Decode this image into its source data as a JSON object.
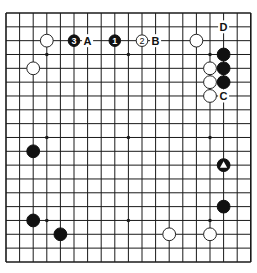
{
  "board": {
    "size": 19,
    "origin_x": 6,
    "origin_y": 13,
    "spacing_x": 13.6,
    "spacing_y": 13.83,
    "stone_radius": 6.4,
    "colors": {
      "black": "#111111",
      "white": "#ffffff",
      "line": "#1a1a1a"
    },
    "star_points": [
      [
        3,
        3
      ],
      [
        9,
        3
      ],
      [
        15,
        3
      ],
      [
        3,
        9
      ],
      [
        9,
        9
      ],
      [
        15,
        9
      ],
      [
        3,
        15
      ],
      [
        9,
        15
      ],
      [
        15,
        15
      ]
    ]
  },
  "stones": [
    {
      "color": "white",
      "col": 3,
      "row": 2
    },
    {
      "color": "white",
      "col": 2,
      "row": 4
    },
    {
      "color": "black",
      "col": 5,
      "row": 2,
      "number": "3"
    },
    {
      "color": "black",
      "col": 8,
      "row": 2,
      "number": "1"
    },
    {
      "color": "white",
      "col": 10,
      "row": 2,
      "number": "2"
    },
    {
      "color": "white",
      "col": 14,
      "row": 2
    },
    {
      "color": "black",
      "col": 16,
      "row": 3
    },
    {
      "color": "black",
      "col": 16,
      "row": 4
    },
    {
      "color": "black",
      "col": 16,
      "row": 5
    },
    {
      "color": "white",
      "col": 15,
      "row": 4
    },
    {
      "color": "white",
      "col": 15,
      "row": 5
    },
    {
      "color": "white",
      "col": 15,
      "row": 6
    },
    {
      "color": "black",
      "col": 2,
      "row": 10
    },
    {
      "color": "black",
      "col": 16,
      "row": 11,
      "marker": "triangle"
    },
    {
      "color": "black",
      "col": 16,
      "row": 14
    },
    {
      "color": "black",
      "col": 2,
      "row": 15
    },
    {
      "color": "black",
      "col": 4,
      "row": 16
    },
    {
      "color": "white",
      "col": 12,
      "row": 16
    },
    {
      "color": "white",
      "col": 15,
      "row": 16
    }
  ],
  "labels": [
    {
      "text": "A",
      "col": 6,
      "row": 2
    },
    {
      "text": "B",
      "col": 11,
      "row": 2
    },
    {
      "text": "C",
      "col": 16,
      "row": 6
    },
    {
      "text": "D",
      "col": 16,
      "row": 1
    }
  ]
}
